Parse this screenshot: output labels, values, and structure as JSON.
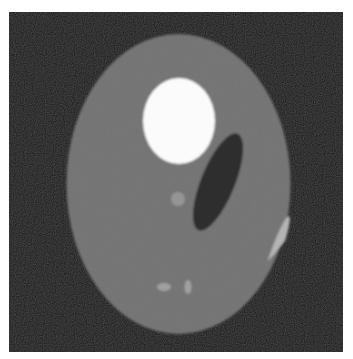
{
  "image": {
    "description": "Shepp-Logan style phantom: gray elliptical head on black square background",
    "canvas": {
      "width": 353,
      "height": 359,
      "background": "#ffffff"
    },
    "background_square": {
      "x": 9,
      "y": 12,
      "width": 334,
      "height": 340,
      "color": "#141414"
    },
    "shapes": [
      {
        "name": "outer-head-ellipse",
        "cx": 178.5,
        "cy": 184,
        "rx": 112,
        "ry": 150,
        "rotate": 0,
        "color": "#707070"
      },
      {
        "name": "bright-upper-ellipse",
        "cx": 179,
        "cy": 121,
        "rx": 36,
        "ry": 43,
        "rotate": 0,
        "color": "#fbfbfb"
      },
      {
        "name": "dark-tilted-ellipse",
        "cx": 218,
        "cy": 182,
        "rx": 17,
        "ry": 52,
        "rotate": 22,
        "color": "#2e2e2e"
      },
      {
        "name": "small-light-circle",
        "cx": 178,
        "cy": 199,
        "rx": 7,
        "ry": 7,
        "rotate": 0,
        "color": "#959595"
      },
      {
        "name": "small-horizontal-ellipse",
        "cx": 164,
        "cy": 287,
        "rx": 7,
        "ry": 4,
        "rotate": 0,
        "color": "#a0a0a0"
      },
      {
        "name": "small-vertical-ellipse",
        "cx": 188,
        "cy": 287,
        "rx": 3.5,
        "ry": 7,
        "rotate": 0,
        "color": "#a0a0a0"
      },
      {
        "name": "right-edge-sliver",
        "cx": 276,
        "cy": 252,
        "rx": 5,
        "ry": 38,
        "rotate": 20,
        "color": "#b4b4b4"
      }
    ]
  }
}
